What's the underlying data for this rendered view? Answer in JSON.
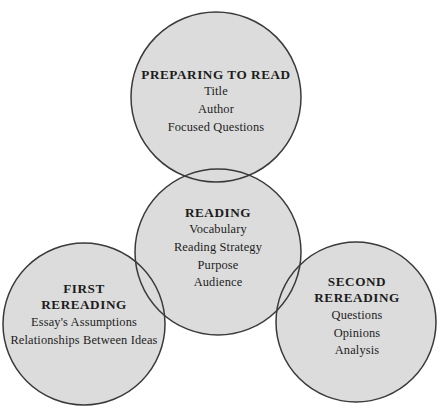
{
  "diagram": {
    "type": "venn-circles",
    "width": 441,
    "height": 413,
    "background_color": "#ffffff",
    "circle_fill_color": "#dcdcdc",
    "circle_stroke_color": "#3a3a3a",
    "text_color": "#1c1c1c",
    "circles": [
      {
        "id": "preparing",
        "title": "PREPARING TO READ",
        "cx": 216,
        "cy": 97,
        "r": 85,
        "items": [
          "Title",
          "Author",
          "Focused Questions"
        ]
      },
      {
        "id": "reading",
        "title": "READING",
        "cx": 218,
        "cy": 252,
        "r": 83,
        "items": [
          "Vocabulary",
          "Reading Strategy",
          "Purpose",
          "Audience"
        ]
      },
      {
        "id": "first-rereading",
        "title": "FIRST REREADING",
        "title_line1": "FIRST",
        "title_line2": "REREADING",
        "cx": 84,
        "cy": 324,
        "r": 81,
        "items": [
          "Essay's Assumptions",
          "Relationships Between Ideas"
        ]
      },
      {
        "id": "second-rereading",
        "title": "SECOND REREADING",
        "title_line1": "SECOND",
        "title_line2": "REREADING",
        "cx": 356,
        "cy": 322,
        "r": 80,
        "items": [
          "Questions",
          "Opinions",
          "Analysis"
        ]
      }
    ]
  },
  "preparing": {
    "title": "PREPARING TO READ",
    "item_0": "Title",
    "item_1": "Author",
    "item_2": "Focused Questions"
  },
  "reading": {
    "title": "READING",
    "item_0": "Vocabulary",
    "item_1": "Reading Strategy",
    "item_2": "Purpose",
    "item_3": "Audience"
  },
  "first_rereading": {
    "title_line1": "FIRST",
    "title_line2": "REREADING",
    "item_0": "Essay's Assumptions",
    "item_1": "Relationships Between Ideas"
  },
  "second_rereading": {
    "title_line1": "SECOND",
    "title_line2": "REREADING",
    "item_0": "Questions",
    "item_1": "Opinions",
    "item_2": "Analysis"
  }
}
